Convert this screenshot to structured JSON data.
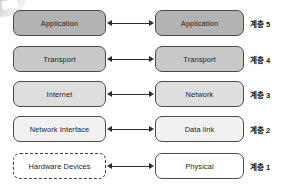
{
  "diagram": {
    "columns": {
      "left_header": "",
      "right_header": ""
    },
    "rows": [
      {
        "left_label": "Application",
        "right_label": "Application",
        "layer_label": "계층 5",
        "fill": "#b3b3b3",
        "left_style": "solid",
        "connector": "double-arrow"
      },
      {
        "left_label": "Transport",
        "right_label": "Transport",
        "layer_label": "계층 4",
        "fill": "#c9c9c9",
        "left_style": "solid",
        "connector": "double-arrow"
      },
      {
        "left_label": "Internet",
        "right_label": "Network",
        "layer_label": "계층 3",
        "fill": "#dedede",
        "left_style": "solid",
        "connector": "double-arrow"
      },
      {
        "left_label": "Network Interface",
        "right_label": "Data link",
        "layer_label": "계층 2",
        "fill": "#f1f1f1",
        "left_style": "solid",
        "connector": "double-arrow"
      },
      {
        "left_label": "Hardware Devices",
        "right_label": "Physical",
        "layer_label": "계층 1",
        "fill": "#ffffff",
        "left_style": "dashed",
        "connector": "double-arrow"
      }
    ],
    "caption": ""
  },
  "colors": {
    "border": "#4a4a4a",
    "arrow": "#2b2b2b",
    "text": "#1b1b1b",
    "background": "#ffffff"
  }
}
